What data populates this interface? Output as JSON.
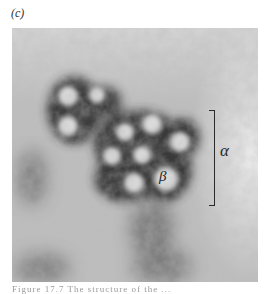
{
  "figure": {
    "panel_label": "(c)",
    "image_type": "electron micrograph, grayscale",
    "annotations": {
      "alpha_label": "α",
      "beta_label": "β"
    },
    "caption_fragment": "Figure 17.7 The structure of the ..."
  },
  "colors": {
    "background": "#ffffff",
    "micrograph_base": "#b9b9b9",
    "particle_light": "#dcdcdc",
    "particle_shell": "#2b2b2b",
    "annotation": "#2a2a2a"
  },
  "particles": [
    {
      "cx": 56,
      "cy": 68,
      "r": 11
    },
    {
      "cx": 85,
      "cy": 67,
      "r": 10
    },
    {
      "cx": 56,
      "cy": 98,
      "r": 11
    },
    {
      "cx": 113,
      "cy": 104,
      "r": 10
    },
    {
      "cx": 140,
      "cy": 96,
      "r": 11
    },
    {
      "cx": 130,
      "cy": 127,
      "r": 11
    },
    {
      "cx": 168,
      "cy": 114,
      "r": 11
    },
    {
      "cx": 100,
      "cy": 128,
      "r": 10
    },
    {
      "cx": 122,
      "cy": 155,
      "r": 11
    },
    {
      "cx": 154,
      "cy": 151,
      "r": 13
    }
  ]
}
